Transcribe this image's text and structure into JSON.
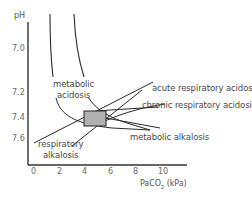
{
  "axes": {
    "y_label": "pH",
    "x_label_main": "PaCO",
    "x_label_sub": "2",
    "x_label_unit": " (kPa)",
    "y_ticks": [
      "7.0",
      "7.2",
      "7.4",
      "7.6"
    ],
    "x_ticks": [
      "0",
      "2",
      "4",
      "6",
      "8",
      "10"
    ]
  },
  "regions": {
    "metabolic_acidosis_line1": "metabolic",
    "metabolic_acidosis_line2": "acidosis",
    "acute_respiratory_acidosis": "acute respiratory acidosis",
    "chronic_respiratory_acidosis": "chronic respiratory acidosis",
    "metabolic_alkalosis": "metabolic alkalosis",
    "respiratory_alkalosis_line1": "respiratory",
    "respiratory_alkalosis_line2": "alkalosis"
  },
  "normal_box": {
    "fill": "#b0b0b0",
    "stroke": "#333333"
  },
  "colors": {
    "line": "#2a2a2a",
    "text": "#4a4a4a",
    "tick": "#6a6a6a"
  }
}
